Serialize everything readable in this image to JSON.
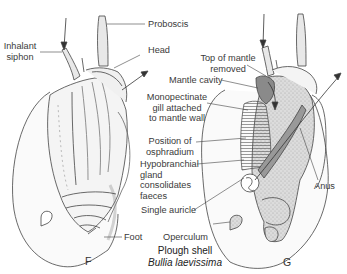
{
  "figure": {
    "caption_common": "Plough shell",
    "caption_species": "Bullia laevissima",
    "panels": [
      {
        "id": "F",
        "letter": "F"
      },
      {
        "id": "G",
        "letter": "G"
      }
    ]
  },
  "labels": {
    "proboscis": "Proboscis",
    "inhalant_siphon_1": "Inhalant",
    "inhalant_siphon_2": "siphon",
    "head": "Head",
    "top_mantle_1": "Top of mantle",
    "top_mantle_2": "removed",
    "mantle_cavity": "Mantle cavity",
    "gill_1": "Monopectinate",
    "gill_2": "gill attached",
    "gill_3": "to mantle wall",
    "osphradium_1": "Position of",
    "osphradium_2": "osphradium",
    "hypo_1": "Hypobranchial",
    "hypo_2": "gland",
    "hypo_3": "consolidates",
    "hypo_4": "faeces",
    "auricle": "Single auricle",
    "foot": "Foot",
    "operculum": "Operculum",
    "anus": "Anus"
  },
  "colors": {
    "line": "#444444",
    "shade_light": "#e6e6e6",
    "shade_mid": "#bdbdbd",
    "shade_dark": "#7a7a7a"
  }
}
